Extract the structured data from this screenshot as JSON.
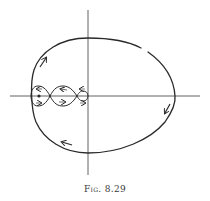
{
  "figure": {
    "caption": "Fig. 8.29",
    "colors": {
      "ink": "#2a2a2a",
      "axis": "#3a3a3a",
      "background": "#ffffff"
    },
    "axes": {
      "horizontal": {
        "x1": 10,
        "x2": 200,
        "y": 96
      },
      "vertical": {
        "x": 88,
        "y1": 10,
        "y2": 175
      }
    },
    "outer_orbit": {
      "left": 31,
      "right": 175,
      "top": 38,
      "bottom": 153,
      "direction": "clockwise",
      "arrows": [
        {
          "position": "upper-left",
          "x": 43,
          "y": 60,
          "direction": "up-right"
        },
        {
          "position": "right",
          "x": 167,
          "y": 111,
          "direction": "down-left"
        },
        {
          "position": "bottom-left",
          "x": 67,
          "y": 143,
          "direction": "left"
        }
      ],
      "gap": {
        "x": 144,
        "y": 50
      }
    },
    "inner_loops": [
      {
        "name": "loop-1",
        "x_left": 31,
        "x_right": 50,
        "half_height": 10,
        "center_dot": {
          "x": 39,
          "y": 96
        },
        "arrows": [
          "left",
          "right"
        ]
      },
      {
        "name": "loop-2",
        "x_left": 50,
        "x_right": 77,
        "half_height": 10,
        "arrows": [
          "left",
          "right"
        ]
      },
      {
        "name": "loop-3",
        "x_left": 77,
        "x_right": 88,
        "half_height": 5,
        "arrows": [
          "left",
          "right"
        ]
      }
    ]
  }
}
